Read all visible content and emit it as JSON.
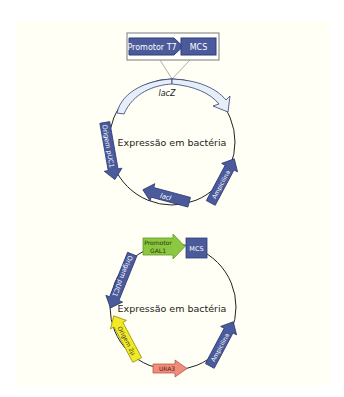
{
  "colors": {
    "background": "#ffffff",
    "panel": "#fffff5",
    "blue_feature": "#4a5a9a",
    "blue_feature_dark": "#2f3d78",
    "lacz_fill": "#e6eff8",
    "green_promoter": "#8dc63f",
    "yellow_origin": "#f2ea26",
    "red_marker": "#ef8c7a",
    "backbone": "#222222",
    "text_light": "#ffffff",
    "text_dark": "#222222"
  },
  "plasmid_top": {
    "inset": {
      "promoter_label": "Promotor T7",
      "mcs_label": "MCS"
    },
    "lacz_label": "lacZ",
    "center_label": "Expressão em bactéria",
    "features": [
      {
        "name": "Origem pUC1",
        "color": "blue"
      },
      {
        "name": "lacI",
        "color": "blue"
      },
      {
        "name": "Ampicilina",
        "color": "blue"
      }
    ],
    "origin_label": "Origem pUC1",
    "laci_label": "lacI",
    "amp_label": "Ampicilina"
  },
  "plasmid_bottom": {
    "promoter_label_line1": "Promotor",
    "promoter_label_line2": "GAL1",
    "mcs_label": "MCS",
    "center_label": "Expressão em bactéria",
    "origin_puc_label": "Origem pUC1",
    "origin_2u_label": "Origem 2μ",
    "ura3_label": "URA3",
    "amp_label": "Ampicilina"
  }
}
